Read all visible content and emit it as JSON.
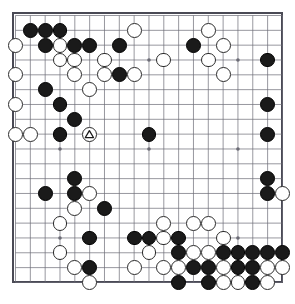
{
  "board": {
    "title": "Go board position",
    "size": 19,
    "geometry": {
      "origin_x": 15.5,
      "origin_y": 15.5,
      "spacing": 14.83,
      "stone_radius": 7.4,
      "frame_left": 12,
      "frame_top": 12,
      "frame_size": 271
    },
    "colors": {
      "board_background": "#ffffff",
      "grid_line": "#6b6b75",
      "frame_border": "#4a4a55",
      "black_stone": "#1a1a1a",
      "white_stone": "#ffffff",
      "white_stone_border": "#2a2a2a",
      "marker": "#1a1a1a"
    },
    "star_points": [
      {
        "col": 4,
        "row": 4
      },
      {
        "col": 10,
        "row": 4
      },
      {
        "col": 16,
        "row": 4
      },
      {
        "col": 4,
        "row": 10
      },
      {
        "col": 10,
        "row": 10
      },
      {
        "col": 16,
        "row": 10
      },
      {
        "col": 4,
        "row": 16
      },
      {
        "col": 10,
        "row": 16
      },
      {
        "col": 16,
        "row": 16
      }
    ],
    "stones": [
      {
        "col": 2,
        "row": 2,
        "color": "black"
      },
      {
        "col": 3,
        "row": 2,
        "color": "black"
      },
      {
        "col": 4,
        "row": 2,
        "color": "black"
      },
      {
        "col": 14,
        "row": 2,
        "color": "white"
      },
      {
        "col": 1,
        "row": 3,
        "color": "white"
      },
      {
        "col": 3,
        "row": 3,
        "color": "black"
      },
      {
        "col": 4,
        "row": 3,
        "color": "white"
      },
      {
        "col": 5,
        "row": 3,
        "color": "black"
      },
      {
        "col": 6,
        "row": 3,
        "color": "black"
      },
      {
        "col": 8,
        "row": 3,
        "color": "black"
      },
      {
        "col": 13,
        "row": 3,
        "color": "black"
      },
      {
        "col": 15,
        "row": 3,
        "color": "white"
      },
      {
        "col": 9,
        "row": 2,
        "color": "white"
      },
      {
        "col": 4,
        "row": 4,
        "color": "white"
      },
      {
        "col": 5,
        "row": 4,
        "color": "white"
      },
      {
        "col": 7,
        "row": 4,
        "color": "white"
      },
      {
        "col": 11,
        "row": 4,
        "color": "white"
      },
      {
        "col": 14,
        "row": 4,
        "color": "white"
      },
      {
        "col": 18,
        "row": 4,
        "color": "black"
      },
      {
        "col": 1,
        "row": 5,
        "color": "white"
      },
      {
        "col": 5,
        "row": 5,
        "color": "white"
      },
      {
        "col": 7,
        "row": 5,
        "color": "white"
      },
      {
        "col": 8,
        "row": 5,
        "color": "black"
      },
      {
        "col": 9,
        "row": 5,
        "color": "white"
      },
      {
        "col": 15,
        "row": 5,
        "color": "white"
      },
      {
        "col": 3,
        "row": 6,
        "color": "black"
      },
      {
        "col": 6,
        "row": 6,
        "color": "white"
      },
      {
        "col": 4,
        "row": 7,
        "color": "black"
      },
      {
        "col": 1,
        "row": 7,
        "color": "white"
      },
      {
        "col": 18,
        "row": 7,
        "color": "black"
      },
      {
        "col": 5,
        "row": 8,
        "color": "black"
      },
      {
        "col": 1,
        "row": 9,
        "color": "white"
      },
      {
        "col": 2,
        "row": 9,
        "color": "white"
      },
      {
        "col": 4,
        "row": 9,
        "color": "black"
      },
      {
        "col": 10,
        "row": 9,
        "color": "black"
      },
      {
        "col": 18,
        "row": 9,
        "color": "black"
      },
      {
        "col": 5,
        "row": 12,
        "color": "black"
      },
      {
        "col": 18,
        "row": 12,
        "color": "black"
      },
      {
        "col": 3,
        "row": 13,
        "color": "black"
      },
      {
        "col": 5,
        "row": 13,
        "color": "black"
      },
      {
        "col": 6,
        "row": 13,
        "color": "white"
      },
      {
        "col": 18,
        "row": 13,
        "color": "black"
      },
      {
        "col": 19,
        "row": 13,
        "color": "white"
      },
      {
        "col": 5,
        "row": 14,
        "color": "white"
      },
      {
        "col": 7,
        "row": 14,
        "color": "black"
      },
      {
        "col": 4,
        "row": 15,
        "color": "white"
      },
      {
        "col": 11,
        "row": 15,
        "color": "white"
      },
      {
        "col": 13,
        "row": 15,
        "color": "white"
      },
      {
        "col": 14,
        "row": 15,
        "color": "white"
      },
      {
        "col": 6,
        "row": 16,
        "color": "black"
      },
      {
        "col": 9,
        "row": 16,
        "color": "black"
      },
      {
        "col": 10,
        "row": 16,
        "color": "black"
      },
      {
        "col": 11,
        "row": 16,
        "color": "white"
      },
      {
        "col": 12,
        "row": 16,
        "color": "black"
      },
      {
        "col": 15,
        "row": 16,
        "color": "white"
      },
      {
        "col": 4,
        "row": 17,
        "color": "white"
      },
      {
        "col": 10,
        "row": 17,
        "color": "white"
      },
      {
        "col": 12,
        "row": 17,
        "color": "black"
      },
      {
        "col": 13,
        "row": 17,
        "color": "white"
      },
      {
        "col": 14,
        "row": 17,
        "color": "white"
      },
      {
        "col": 15,
        "row": 17,
        "color": "black"
      },
      {
        "col": 16,
        "row": 17,
        "color": "black"
      },
      {
        "col": 17,
        "row": 17,
        "color": "black"
      },
      {
        "col": 18,
        "row": 17,
        "color": "black"
      },
      {
        "col": 19,
        "row": 17,
        "color": "black"
      },
      {
        "col": 5,
        "row": 18,
        "color": "white"
      },
      {
        "col": 6,
        "row": 18,
        "color": "black"
      },
      {
        "col": 9,
        "row": 18,
        "color": "white"
      },
      {
        "col": 11,
        "row": 18,
        "color": "white"
      },
      {
        "col": 12,
        "row": 18,
        "color": "white"
      },
      {
        "col": 13,
        "row": 18,
        "color": "black"
      },
      {
        "col": 14,
        "row": 18,
        "color": "black"
      },
      {
        "col": 15,
        "row": 18,
        "color": "white"
      },
      {
        "col": 16,
        "row": 18,
        "color": "black"
      },
      {
        "col": 17,
        "row": 18,
        "color": "black"
      },
      {
        "col": 18,
        "row": 18,
        "color": "white"
      },
      {
        "col": 19,
        "row": 18,
        "color": "white"
      },
      {
        "col": 6,
        "row": 19,
        "color": "white"
      },
      {
        "col": 12,
        "row": 19,
        "color": "black"
      },
      {
        "col": 14,
        "row": 19,
        "color": "black"
      },
      {
        "col": 15,
        "row": 19,
        "color": "white"
      },
      {
        "col": 16,
        "row": 19,
        "color": "white"
      },
      {
        "col": 17,
        "row": 19,
        "color": "black"
      },
      {
        "col": 18,
        "row": 19,
        "color": "white"
      }
    ],
    "markers": [
      {
        "col": 6,
        "row": 9,
        "shape": "triangle",
        "on": "white"
      }
    ]
  }
}
